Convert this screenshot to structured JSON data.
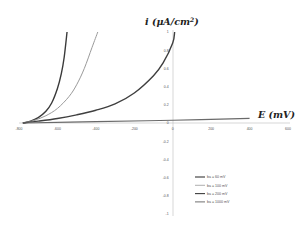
{
  "chart_data": {
    "type": "line",
    "title": "",
    "xlabel": "E (mV)",
    "ylabel": "i (μA/cm²)",
    "xlim": [
      -800,
      600
    ],
    "ylim": [
      -1,
      1
    ],
    "x_ticks": [
      "-800",
      "-600",
      "-400",
      "-200",
      "0",
      "200",
      "400",
      "600"
    ],
    "y_ticks": [
      "1",
      "0.8",
      "0.6",
      "0.4",
      "0.2",
      "0",
      "-0.2",
      "-0.4",
      "-0.6",
      "-0.8",
      "-1"
    ],
    "grid": false,
    "legend_position": "lower right",
    "series": [
      {
        "name": "ba = 60 mV",
        "color": "#3a3a3a",
        "width": 1.4,
        "x": [
          -780,
          -740,
          -700,
          -660,
          -630,
          -600,
          -580,
          -565,
          -550
        ],
        "y": [
          0,
          0.02,
          0.06,
          0.13,
          0.22,
          0.38,
          0.54,
          0.72,
          1.0
        ]
      },
      {
        "name": "ba = 100 mV",
        "color": "#9a9a9a",
        "width": 1.0,
        "x": [
          -780,
          -720,
          -660,
          -600,
          -540,
          -500,
          -460,
          -420,
          -390
        ],
        "y": [
          0,
          0.03,
          0.08,
          0.16,
          0.29,
          0.42,
          0.6,
          0.83,
          1.0
        ]
      },
      {
        "name": "ba = 200 mV",
        "color": "#3f3f3f",
        "width": 1.4,
        "x": [
          -780,
          -700,
          -600,
          -500,
          -400,
          -300,
          -200,
          -100,
          -50,
          0,
          10
        ],
        "y": [
          0,
          0.02,
          0.05,
          0.09,
          0.14,
          0.21,
          0.33,
          0.52,
          0.66,
          0.88,
          1.0
        ]
      },
      {
        "name": "ba = 1000 mV",
        "color": "#6a6a6a",
        "width": 1.2,
        "x": [
          -780,
          -400,
          0,
          400
        ],
        "y": [
          0,
          0.015,
          0.03,
          0.05
        ]
      }
    ]
  }
}
